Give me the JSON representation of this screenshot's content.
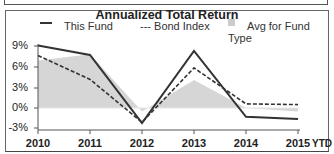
{
  "chart_data": {
    "type": "line",
    "title": "Annualized Total Return",
    "xlabel": "",
    "ylabel": "",
    "categories": [
      "2010",
      "2011",
      "2012",
      "2013",
      "2014",
      "2015"
    ],
    "x_suffix_label": "YTD",
    "ylim": [
      -3,
      9
    ],
    "yticks": [
      "9%",
      "6%",
      "3%",
      "0%",
      "-3%"
    ],
    "grid": false,
    "legend_position": "top",
    "series": [
      {
        "name": "This Fund",
        "style": "solid line",
        "color": "#333333",
        "values": [
          9.2,
          7.8,
          -2.2,
          8.4,
          -1.3,
          -1.6
        ]
      },
      {
        "name": "Bond Index",
        "style": "dashed line",
        "color": "#333333",
        "values": [
          7.7,
          4.2,
          -2.1,
          5.9,
          0.6,
          0.5
        ]
      },
      {
        "name": "Avg for Fund Type",
        "style": "shaded area",
        "color": "#d4d4d4",
        "values": [
          7.0,
          7.9,
          -0.5,
          4.1,
          0.0,
          -0.5
        ]
      }
    ]
  },
  "legend": {
    "this_fund": "This Fund",
    "bond_index": "--- Bond Index",
    "avg_type": "Avg for Fund Type"
  }
}
